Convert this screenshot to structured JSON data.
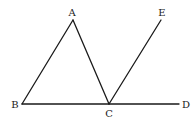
{
  "diagram": {
    "type": "geometry-figure",
    "stroke_color": "#1a1a1a",
    "points": {
      "A": {
        "label": "A",
        "x": 73,
        "y": 20,
        "label_x": 72,
        "label_y": 13
      },
      "B": {
        "label": "B",
        "x": 22,
        "y": 104,
        "label_x": 15,
        "label_y": 105
      },
      "C": {
        "label": "C",
        "x": 109,
        "y": 104,
        "label_x": 109,
        "label_y": 114
      },
      "D": {
        "label": "D",
        "x": 179,
        "y": 104,
        "label_x": 186,
        "label_y": 105
      },
      "E": {
        "label": "E",
        "x": 161,
        "y": 20,
        "label_x": 162,
        "label_y": 13
      }
    },
    "segments": [
      {
        "name": "AB",
        "from": "A",
        "to": "B"
      },
      {
        "name": "AC",
        "from": "A",
        "to": "C"
      },
      {
        "name": "BD",
        "from": "B",
        "to": "D"
      },
      {
        "name": "CE",
        "from": "C",
        "to": "E"
      }
    ]
  }
}
